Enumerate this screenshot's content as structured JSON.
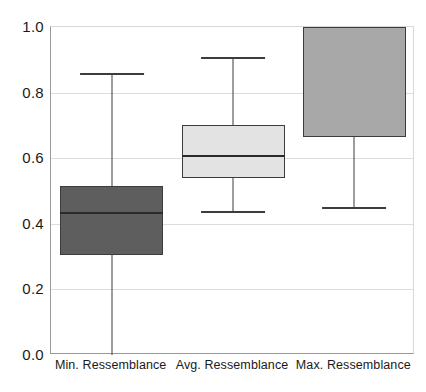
{
  "chart_data": {
    "type": "box",
    "title": "",
    "xlabel": "",
    "ylabel": "",
    "ylim": [
      0.0,
      1.0
    ],
    "grid": true,
    "legend": "none",
    "categories": [
      "Min. Ressemblance",
      "Avg. Ressemblance",
      "Max. Ressemblance"
    ],
    "y_tick_labels": [
      "0.0",
      "0.2",
      "0.4",
      "0.6",
      "0.8",
      "1.0"
    ],
    "y_tick_values": [
      0.0,
      0.2,
      0.4,
      0.6,
      0.8,
      1.0
    ],
    "boxes": [
      {
        "label": "Min. Ressemblance",
        "whisker_low": 0.0,
        "q1": 0.305,
        "median": 0.435,
        "q3": 0.515,
        "whisker_high": 0.86,
        "fill": "#5e5e5e",
        "stroke": "#3c3c3c"
      },
      {
        "label": "Avg. Ressemblance",
        "whisker_low": 0.44,
        "q1": 0.54,
        "median": 0.61,
        "q3": 0.7,
        "whisker_high": 0.91,
        "fill": "#e3e3e3",
        "stroke": "#3c3c3c"
      },
      {
        "label": "Max. Ressemblance",
        "whisker_low": 0.45,
        "q1": 0.665,
        "median": 1.0,
        "q3": 1.0,
        "whisker_high": 1.0,
        "fill": "#a8a8a8",
        "stroke": "#3c3c3c"
      }
    ]
  },
  "style": {
    "background": "#ffffff",
    "axis_color": "#9a9a9a",
    "grid_color": "#dcdcdc",
    "text_color": "#1a1a1a"
  }
}
